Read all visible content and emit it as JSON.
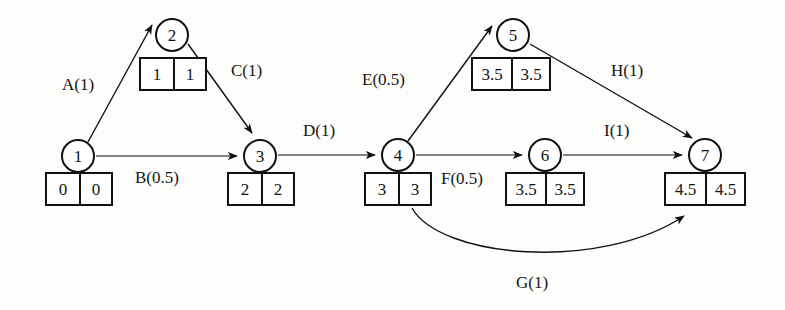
{
  "diagram": {
    "background_color": "#fdfdfc",
    "line_color": "#111111"
  },
  "nodes": [
    {
      "id": "1",
      "label": "1",
      "cx": 78,
      "cy": 156,
      "r": 17,
      "box": {
        "x": 45,
        "y": 172,
        "w": 68,
        "earliest": "0",
        "latest": "0"
      }
    },
    {
      "id": "2",
      "label": "2",
      "cx": 172,
      "cy": 35,
      "r": 17,
      "box": {
        "x": 139,
        "y": 57,
        "w": 68,
        "earliest": "1",
        "latest": "1"
      }
    },
    {
      "id": "3",
      "label": "3",
      "cx": 260,
      "cy": 156,
      "r": 17,
      "box": {
        "x": 227,
        "y": 172,
        "w": 68,
        "earliest": "2",
        "latest": "2"
      }
    },
    {
      "id": "4",
      "label": "4",
      "cx": 398,
      "cy": 155,
      "r": 17,
      "box": {
        "x": 364,
        "y": 172,
        "w": 68,
        "earliest": "3",
        "latest": "3"
      }
    },
    {
      "id": "5",
      "label": "5",
      "cx": 513,
      "cy": 35,
      "r": 17,
      "box": {
        "x": 471,
        "y": 57,
        "w": 80,
        "earliest": "3.5",
        "latest": "3.5"
      }
    },
    {
      "id": "6",
      "label": "6",
      "cx": 545,
      "cy": 155,
      "r": 17,
      "box": {
        "x": 505,
        "y": 172,
        "w": 80,
        "earliest": "3.5",
        "latest": "3.5"
      }
    },
    {
      "id": "7",
      "label": "7",
      "cx": 705,
      "cy": 155,
      "r": 17,
      "box": {
        "x": 664,
        "y": 172,
        "w": 82,
        "earliest": "4.5",
        "latest": "4.5"
      }
    }
  ],
  "edges": [
    {
      "id": "A",
      "label": "A(1)",
      "from": "1",
      "to": "2",
      "duration": 1,
      "shape": "straight",
      "label_x": 62,
      "label_y": 76
    },
    {
      "id": "B",
      "label": "B(0.5)",
      "from": "1",
      "to": "3",
      "duration": 0.5,
      "shape": "straight",
      "label_x": 135,
      "label_y": 169
    },
    {
      "id": "C",
      "label": "C(1)",
      "from": "2",
      "to": "3",
      "duration": 1,
      "shape": "straight",
      "label_x": 231,
      "label_y": 62
    },
    {
      "id": "D",
      "label": "D(1)",
      "from": "3",
      "to": "4",
      "duration": 1,
      "shape": "straight",
      "label_x": 303,
      "label_y": 122
    },
    {
      "id": "E",
      "label": "E(0.5)",
      "from": "4",
      "to": "5",
      "duration": 0.5,
      "shape": "straight",
      "label_x": 362,
      "label_y": 71
    },
    {
      "id": "F",
      "label": "F(0.5)",
      "from": "4",
      "to": "6",
      "duration": 0.5,
      "shape": "straight",
      "label_x": 441,
      "label_y": 170
    },
    {
      "id": "G",
      "label": "G(1)",
      "from": "4",
      "to": "7",
      "duration": 1,
      "shape": "curved",
      "label_x": 516,
      "label_y": 274
    },
    {
      "id": "H",
      "label": "H(1)",
      "from": "5",
      "to": "7",
      "duration": 1,
      "shape": "straight",
      "label_x": 611,
      "label_y": 62
    },
    {
      "id": "I",
      "label": "I(1)",
      "from": "6",
      "to": "7",
      "duration": 1,
      "shape": "straight",
      "label_x": 604,
      "label_y": 122
    }
  ]
}
